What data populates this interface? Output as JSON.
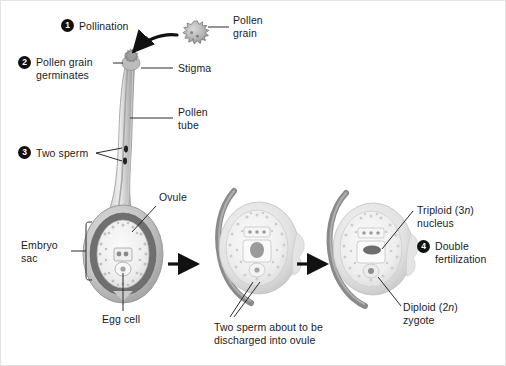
{
  "figure": {
    "background": "#ffffff",
    "border_color": "#e3e3e3",
    "width": 506,
    "height": 366
  },
  "palette": {
    "ink": "#1b1b1b",
    "badge_fill": "#111111",
    "badge_text": "#ffffff",
    "leader_line": "#2a2a2a",
    "style_light": "#d6d6d6",
    "style_mid": "#b4b4b4",
    "style_dark": "#8d8d8d",
    "integument_dark": "#6f6f6f",
    "integument_mid": "#a8a8a8",
    "integument_light": "#cfcfcf",
    "sac_fill": "#f1f1f1",
    "sac_stipple": "#c9c9c9",
    "nucleus_dark": "#7a7a7a",
    "tube_gray": "#8a8a8a",
    "arrow_black": "#111111"
  },
  "steps": [
    {
      "number": "1",
      "label": "Pollination"
    },
    {
      "number": "2",
      "label": "Pollen grain\ngerminates"
    },
    {
      "number": "3",
      "label": "Two sperm"
    },
    {
      "number": "4",
      "label": "Double\nfertilization"
    }
  ],
  "labels": {
    "pollination": "Pollination",
    "pollen_grain": "Pollen\ngrain",
    "pollen_grain_germinates": "Pollen grain\ngerminates",
    "stigma": "Stigma",
    "pollen_tube": "Pollen\ntube",
    "two_sperm": "Two sperm",
    "ovule": "Ovule",
    "embryo_sac": "Embryo\nsac",
    "egg_cell": "Egg cell",
    "two_sperm_discharged": "Two sperm about to be\ndischarged into ovule",
    "triploid_nucleus_pre": "Triploid (3",
    "triploid_nucleus_italic": "n",
    "triploid_nucleus_post": ")",
    "triploid_nucleus_line2": "nucleus",
    "double_fertilization": "Double\nfertilization",
    "diploid_zygote_pre": "Diploid (2",
    "diploid_zygote_italic": "n",
    "diploid_zygote_post": ")",
    "diploid_zygote_line2": "zygote"
  },
  "stages": [
    {
      "name": "stage-1-ovule-with-pollen-tube",
      "caption": "Egg cell"
    },
    {
      "name": "stage-2-sperm-discharge",
      "caption": "Two sperm about to be discharged into ovule"
    },
    {
      "name": "stage-3-double-fertilization",
      "caption": "Triploid (3n) nucleus / Diploid (2n) zygote"
    }
  ],
  "arrows": [
    {
      "name": "stage-arrow-1",
      "direction": "right"
    },
    {
      "name": "stage-arrow-2",
      "direction": "right"
    },
    {
      "name": "pollination-arrow",
      "direction": "curved-down-left"
    }
  ]
}
